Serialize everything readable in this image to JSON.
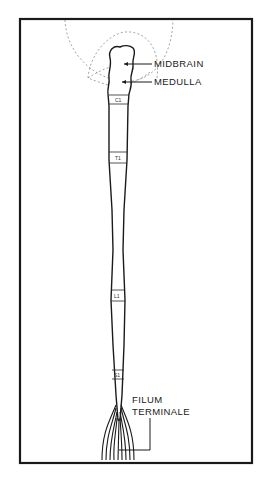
{
  "diagram": {
    "type": "anatomical",
    "labels": {
      "midbrain": "MIDBRAIN",
      "medulla": "MEDULLA",
      "filum_line1": "FILUM",
      "filum_line2": "TERMINALE"
    },
    "segments": [
      {
        "id": "c1",
        "label": "C1"
      },
      {
        "id": "t1",
        "label": "T1"
      },
      {
        "id": "l1",
        "label": "L1"
      },
      {
        "id": "s1",
        "label": "S1"
      }
    ],
    "colors": {
      "line": "#1a1a1a",
      "dashed_outline": "#9a9a9a",
      "background": "#ffffff"
    }
  }
}
